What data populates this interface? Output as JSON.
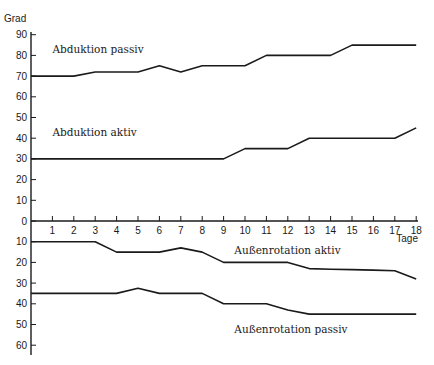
{
  "chart_data": {
    "type": "line",
    "title": "",
    "xlabel": "Tage",
    "ylabel": "Grad",
    "x": [
      0,
      1,
      2,
      3,
      4,
      5,
      6,
      7,
      8,
      9,
      10,
      11,
      12,
      13,
      14,
      15,
      16,
      17,
      18
    ],
    "x_ticks": [
      1,
      2,
      3,
      4,
      5,
      6,
      7,
      8,
      9,
      10,
      11,
      12,
      13,
      14,
      15,
      16,
      17,
      18
    ],
    "y_ticks_upper": [
      90,
      80,
      70,
      60,
      50,
      40,
      30,
      20,
      10,
      0
    ],
    "y_ticks_lower": [
      10,
      20,
      30,
      40,
      50,
      60
    ],
    "ylim": [
      -65,
      92
    ],
    "xlim": [
      0,
      18
    ],
    "grid": false,
    "legend": "inline labels",
    "note": "Lower half (below 0) shows Außenrotation in degrees plotted downward",
    "series": [
      {
        "name": "Abduktion passiv",
        "direction": "up",
        "values": [
          70,
          70,
          70,
          72,
          72,
          72,
          75,
          72,
          75,
          75,
          75,
          80,
          80,
          80,
          80,
          85,
          85,
          85,
          85
        ]
      },
      {
        "name": "Abduktion aktiv",
        "direction": "up",
        "values": [
          30,
          30,
          30,
          30,
          30,
          30,
          30,
          30,
          30,
          30,
          35,
          35,
          35,
          40,
          40,
          40,
          40,
          40,
          45
        ]
      },
      {
        "name": "Außenrotation aktiv",
        "direction": "down",
        "values": [
          10,
          10,
          10,
          10,
          15,
          15,
          15,
          13,
          15,
          20,
          20,
          20,
          20,
          23,
          23.3,
          23.5,
          23.7,
          24,
          28
        ]
      },
      {
        "name": "Außenrotation passiv",
        "direction": "down",
        "values": [
          35,
          35,
          35,
          35,
          35,
          32.5,
          35,
          35,
          35,
          40,
          40,
          40,
          43,
          45,
          45,
          45,
          45,
          45,
          45
        ]
      }
    ],
    "annotations": [
      {
        "text": "Abduktion passiv",
        "x": 1,
        "y": 83
      },
      {
        "text": "Abduktion aktiv",
        "x": 1,
        "y": 43
      },
      {
        "text": "Außenrotation aktiv",
        "x": 9.5,
        "y": -14
      },
      {
        "text": "Außenrotation passiv",
        "x": 9.5,
        "y": -52
      }
    ]
  }
}
